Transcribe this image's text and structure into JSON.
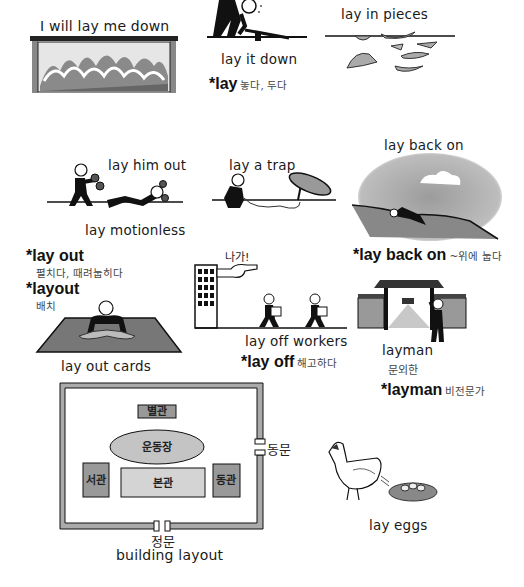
{
  "panels": {
    "lay_me_down": {
      "caption": "I will lay me down"
    },
    "lay_it_down": {
      "caption": "lay it down",
      "term": "*lay",
      "meaning": "놓다, 두다"
    },
    "lay_in_pieces": {
      "caption": "lay in pieces"
    },
    "lay_him_out": {
      "caption_top": "lay him out",
      "caption_bottom": "lay motionless"
    },
    "lay_a_trap": {
      "caption": "lay a trap"
    },
    "lay_back_on": {
      "caption": "lay back on",
      "term": "*lay back on",
      "meaning": "~위에 눕다"
    },
    "lay_out": {
      "term": "*lay out",
      "meaning": "펼치다, 때려눕히다",
      "term2": "*layout",
      "meaning2": "배치",
      "caption": "lay out cards"
    },
    "lay_off": {
      "shout": "나가!",
      "caption": "lay off workers",
      "term": "*lay off",
      "meaning": "해고하다"
    },
    "layman": {
      "caption": "layman",
      "caption_ko": "문외한",
      "term": "*layman",
      "meaning": "비전문가"
    },
    "building_layout": {
      "buildings": {
        "annex": "별관",
        "field": "운동장",
        "west": "서관",
        "main": "본관",
        "east": "동관"
      },
      "east_gate": "동문",
      "main_gate": "정문",
      "caption": "building layout"
    },
    "lay_eggs": {
      "caption": "lay eggs"
    }
  },
  "colors": {
    "ink": "#111111",
    "gray_fill": "#9a9a9a",
    "light_fill": "#cfcfcf",
    "mid_fill": "#b5b5b5"
  }
}
